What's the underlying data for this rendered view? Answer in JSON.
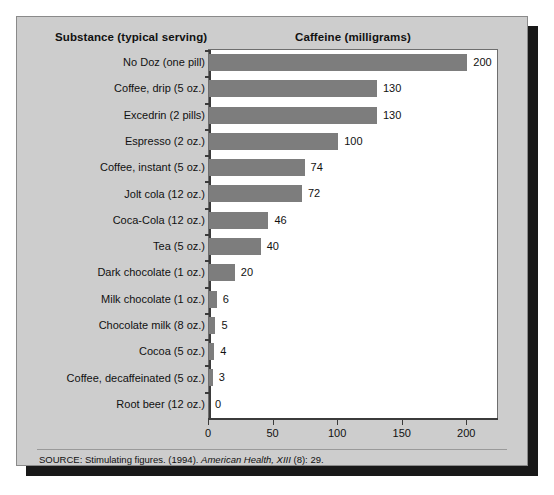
{
  "figure": {
    "background_color": "#cdcdcd",
    "plot_background_color": "#ffffff",
    "bar_color": "#7d7d7d",
    "axis_color": "#3b3b3b"
  },
  "header": {
    "left_title": "Substance (typical serving)",
    "right_title": "Caffeine (milligrams)"
  },
  "source": {
    "prefix": "SOURCE: Stimulating figures. (1994). ",
    "journal": "American Health, XIII",
    "suffix": " (8): 29."
  },
  "chart_data": {
    "type": "bar",
    "orientation": "horizontal",
    "title": "Caffeine (milligrams)",
    "xlabel": "Caffeine (milligrams)",
    "ylabel": "Substance (typical serving)",
    "xlim": [
      0,
      223
    ],
    "xticks": [
      0,
      50,
      100,
      150,
      200
    ],
    "xticklabels": [
      "0",
      "50",
      "100",
      "150",
      "200"
    ],
    "grid": false,
    "legend": false,
    "categories": [
      "No Doz (one pill)",
      "Coffee, drip (5 oz.)",
      "Excedrin (2 pills)",
      "Espresso (2 oz.)",
      "Coffee, instant (5 oz.)",
      "Jolt cola (12 oz.)",
      "Coca-Cola (12 oz.)",
      "Tea (5 oz.)",
      "Dark chocolate (1 oz.)",
      "Milk chocolate (1 oz.)",
      "Chocolate milk (8 oz.)",
      "Cocoa (5 oz.)",
      "Coffee, decaffeinated (5 oz.)",
      "Root beer (12 oz.)"
    ],
    "values": [
      200,
      130,
      130,
      100,
      74,
      72,
      46,
      40,
      20,
      6,
      5,
      4,
      3,
      0
    ],
    "value_labels": [
      "200",
      "130",
      "130",
      "100",
      "74",
      "72",
      "46",
      "40",
      "20",
      "6",
      "5",
      "4",
      "3",
      "0"
    ]
  }
}
